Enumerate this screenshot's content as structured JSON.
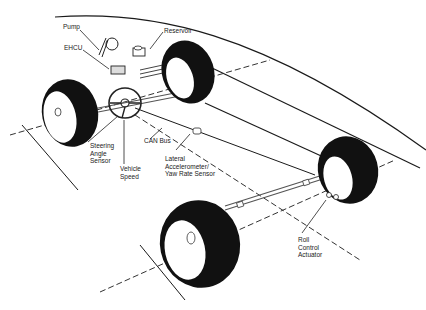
{
  "diagram": {
    "labels": {
      "pump": "Pump",
      "reservoir": "Reservoir",
      "ehcu": "EHCU",
      "steering_angle_sensor": "Steering\nAngle\nSensor",
      "vehicle_speed": "Vehicle\nSpeed",
      "can_bus": "CAN Bus",
      "lateral_sensor": "Lateral\nAccelerometer/\nYaw Rate Sensor",
      "roll_control_actuator": "Roll\nControl\nActuator"
    },
    "colors": {
      "tire": "#111111",
      "line": "#1a1a1a",
      "background": "#ffffff"
    }
  }
}
